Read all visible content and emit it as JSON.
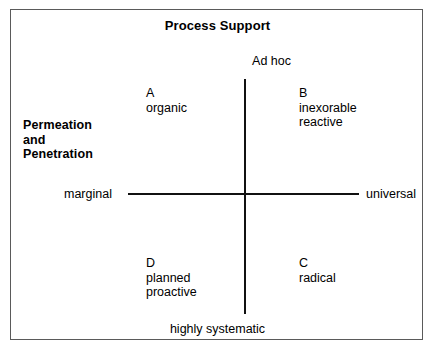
{
  "chart_data": {
    "type": "scatter",
    "title": "Process Support",
    "xlabel": "Process Support",
    "ylabel": "Permeation and Penetration",
    "layout": "2x2 quadrant matrix with cross axes",
    "grid": false,
    "legend": "none",
    "x_axis": {
      "name": "Permeation and Penetration",
      "left_label": "marginal",
      "right_label": "universal"
    },
    "y_axis": {
      "name": "Process Support",
      "top_label": "Ad hoc",
      "bottom_label": "highly systematic"
    },
    "quadrants": [
      {
        "key": "A",
        "position": "top-left",
        "lines": [
          "organic"
        ],
        "x": "marginal",
        "y": "Ad hoc"
      },
      {
        "key": "B",
        "position": "top-right",
        "lines": [
          "inexorable",
          "reactive"
        ],
        "x": "universal",
        "y": "Ad hoc"
      },
      {
        "key": "C",
        "position": "bottom-right",
        "lines": [
          "radical"
        ],
        "x": "universal",
        "y": "highly systematic"
      },
      {
        "key": "D",
        "position": "bottom-left",
        "lines": [
          "planned",
          "proactive"
        ],
        "x": "marginal",
        "y": "highly systematic"
      }
    ]
  },
  "figure": {
    "title": "Process Support",
    "axis_title_left": {
      "line1": "Permeation",
      "line2": "and",
      "line3": "Penetration"
    },
    "labels": {
      "top": "Ad hoc",
      "bottom": "highly systematic",
      "left": "marginal",
      "right": "universal"
    },
    "quadrant_a": {
      "key": "A",
      "line1": "organic"
    },
    "quadrant_b": {
      "key": "B",
      "line1": "inexorable",
      "line2": "reactive"
    },
    "quadrant_c": {
      "key": "C",
      "line1": "radical"
    },
    "quadrant_d": {
      "key": "D",
      "line1": "planned",
      "line2": "proactive"
    },
    "colors": {
      "axis": "#111111",
      "border": "#5a5a5a",
      "background": "#ffffff",
      "text": "#000000"
    }
  }
}
